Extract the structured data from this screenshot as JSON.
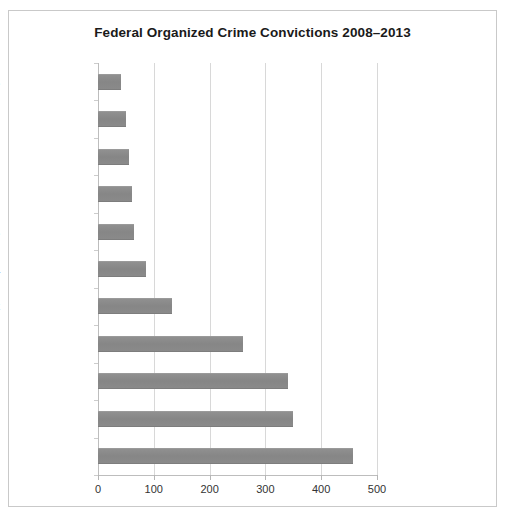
{
  "chart_data": {
    "type": "bar",
    "orientation": "horizontal",
    "title": "Federal Organized Crime Convictions 2008–2013",
    "xlabel": "",
    "ylabel": "",
    "categories": [
      "Las Vegas",
      "Miami",
      "San Francisco",
      "San Diego",
      "Los Angeles",
      "Philadelphia",
      "Newark",
      "Tampa/Orlando",
      "Boston",
      "Manhattan",
      "Brooklyn"
    ],
    "values": [
      41,
      50,
      55,
      61,
      64,
      86,
      132,
      260,
      340,
      349,
      457
    ],
    "xlim": [
      0,
      500
    ],
    "xticks": [
      0,
      100,
      200,
      300,
      400,
      500
    ],
    "xtick_labels": [
      "0",
      "100",
      "200",
      "300",
      "400",
      "500"
    ],
    "grid": "vertical",
    "legend": "none",
    "bar_color": "#8c8c8c",
    "title_color": "#1a1a1a",
    "gridline_color": "#d8d8d8",
    "frame_color": "#c9c9c9",
    "background": "#ffffff"
  }
}
